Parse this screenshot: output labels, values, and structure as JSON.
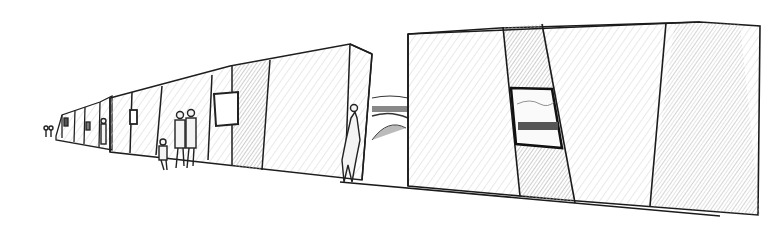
{
  "image": {
    "description": "Pencil sketch of a row of angular monolithic buildings in perspective with small human figures walking alongside",
    "colors": {
      "paper": "#ffffff",
      "line": "#1e1e1e",
      "shade_light": "#e6e6e6",
      "shade_mid": "#c8c8c8",
      "shade_dark": "#8a8a8a"
    },
    "figures_count": 6
  }
}
